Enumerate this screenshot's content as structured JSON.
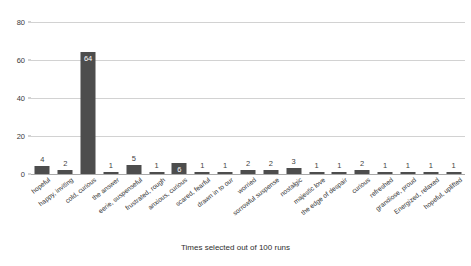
{
  "chart_data": {
    "type": "bar",
    "title": "",
    "xlabel": "Times selected out of 100 runs",
    "ylabel": "",
    "ylim": [
      0,
      80
    ],
    "yticks": [
      0,
      20,
      40,
      60,
      80
    ],
    "grid": true,
    "legend": false,
    "bar_color": "#4d4d4d",
    "gridline_color": "#d2d2d2",
    "axis_color": "#a8a8a8",
    "categories": [
      "hopeful",
      "happy, inviting",
      "cold, curious",
      "the answer",
      "eerie, suspenseful",
      "frustrated, rough",
      "anxious, curious",
      "scared, fearful",
      "drawn in to our",
      "worried",
      "sorrowful suspense",
      "nostalgic",
      "majestic love",
      "the edge of despair",
      "curious",
      "refreshed",
      "grandiose, proud",
      "Energized, relaxed",
      "hopeful, uplifted"
    ],
    "values": [
      4,
      2,
      64,
      1,
      5,
      1,
      6,
      1,
      1,
      2,
      2,
      3,
      1,
      1,
      2,
      1,
      1,
      1,
      1
    ],
    "value_label_placement": [
      "outside",
      "outside",
      "inside",
      "outside",
      "outside",
      "outside",
      "inside",
      "outside",
      "outside",
      "outside",
      "outside",
      "outside",
      "outside",
      "outside",
      "outside",
      "outside",
      "outside",
      "outside",
      "outside"
    ]
  }
}
